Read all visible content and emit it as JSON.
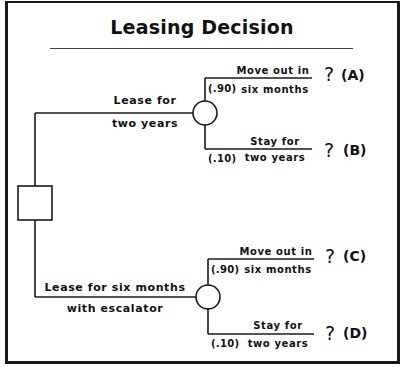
{
  "title": "Leasing Decision",
  "decision_node": {
    "shape": "square"
  },
  "alternatives": [
    {
      "label_line1": "Lease for",
      "label_line2": "two years",
      "chance_node": {
        "shape": "circle"
      },
      "outcomes": [
        {
          "prob": "(.90)",
          "line1": "Move out in",
          "line2": "six months",
          "value": "?",
          "tag": "(A)"
        },
        {
          "prob": "(.10)",
          "line1": "Stay for",
          "line2": "two years",
          "value": "?",
          "tag": "(B)"
        }
      ]
    },
    {
      "label_line1": "Lease for six months",
      "label_line2": "with escalator",
      "chance_node": {
        "shape": "circle"
      },
      "outcomes": [
        {
          "prob": "(.90)",
          "line1": "Move out in",
          "line2": "six months",
          "value": "?",
          "tag": "(C)"
        },
        {
          "prob": "(.10)",
          "line1": "Stay for",
          "line2": "two years",
          "value": "?",
          "tag": "(D)"
        }
      ]
    }
  ],
  "colors": {
    "line": "#1a1a1a",
    "background": "#ffffff"
  }
}
